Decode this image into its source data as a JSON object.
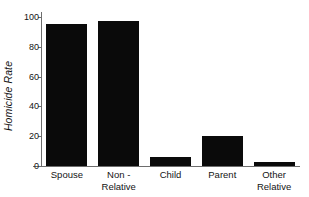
{
  "chart_data": {
    "type": "bar",
    "title": "",
    "xlabel": "",
    "ylabel": "Homicide Rate",
    "categories": [
      "Spouse",
      "Non - Relative",
      "Child",
      "Parent",
      "Other Relative"
    ],
    "category_lines": [
      [
        "Spouse"
      ],
      [
        "Non -",
        "Relative"
      ],
      [
        "Child"
      ],
      [
        "Parent"
      ],
      [
        "Other",
        "Relative"
      ]
    ],
    "values": [
      95,
      97,
      6,
      20,
      3
    ],
    "ylim": [
      0,
      100
    ],
    "yticks": [
      0,
      20,
      40,
      60,
      80,
      100
    ],
    "ytick_labels": [
      "0",
      "20",
      "40",
      "60",
      "80",
      "100"
    ],
    "grid": false,
    "legend": "none",
    "bar_color": "#0a0a0a",
    "axis_color": "#6d6d6d"
  }
}
